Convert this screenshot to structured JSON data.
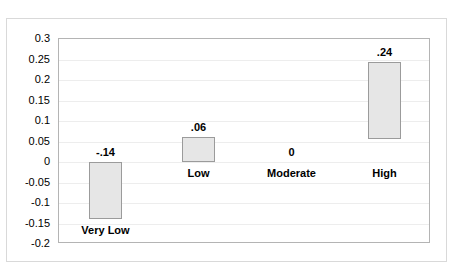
{
  "chart_data": {
    "type": "bar",
    "title": "",
    "xlabel": "",
    "ylabel": "",
    "categories": [
      "Very Low",
      "Low",
      "Moderate",
      "High"
    ],
    "values": [
      -0.14,
      0.06,
      0,
      0.24
    ],
    "data_labels": [
      "-.14",
      ".06",
      "0",
      ".24"
    ],
    "bar_ranges": [
      {
        "category": "Very Low",
        "bottom": -0.14,
        "top": 0
      },
      {
        "category": "Low",
        "bottom": 0,
        "top": 0.06
      },
      {
        "category": "Moderate",
        "bottom": 0,
        "top": 0
      },
      {
        "category": "High",
        "bottom": 0.055,
        "top": 0.245
      }
    ],
    "ylim": [
      -0.2,
      0.3
    ],
    "ytick_step": 0.05,
    "ytick_labels": [
      "0.3",
      "0.25",
      "0.2",
      "0.15",
      "0.1",
      "0.05",
      "0",
      "-0.05",
      "-0.1",
      "-0.15",
      "-0.2"
    ],
    "ytick_values": [
      0.3,
      0.25,
      0.2,
      0.15,
      0.1,
      0.05,
      0,
      -0.05,
      -0.1,
      -0.15,
      -0.2
    ],
    "grid": true,
    "legend": "none",
    "bar_fill_color": "#e6e6e6",
    "bar_border_color": "#9b9b9b",
    "plot_border_color": "#b4b4b4",
    "gridline_color": "#ededed"
  }
}
